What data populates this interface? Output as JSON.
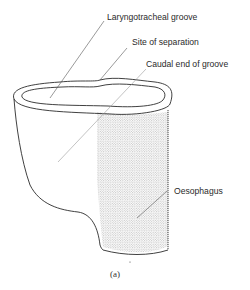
{
  "figure": {
    "caption": "(a)",
    "labels": {
      "laryngotracheal_groove": "Laryngotracheal groove",
      "site_of_separation": "Site of separation",
      "caudal_end_of_groove": "Caudal end of groove",
      "oesophagus": "Oesophagus"
    },
    "colors": {
      "line": "#2b2b2b",
      "stipple": "#8a8a8a",
      "background": "#ffffff"
    }
  }
}
